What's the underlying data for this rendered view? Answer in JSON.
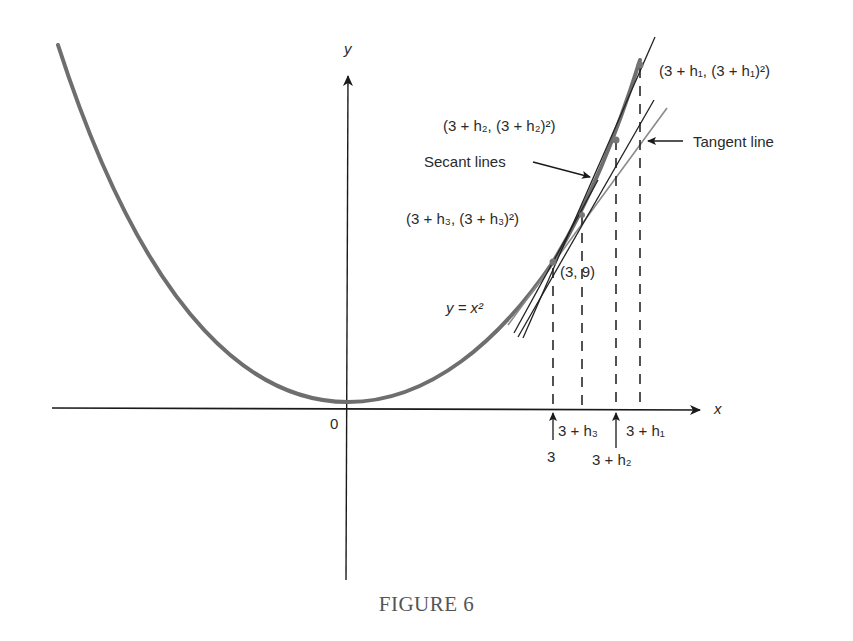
{
  "figure": {
    "caption": "FIGURE 6",
    "axes": {
      "x_label": "x",
      "y_label": "y",
      "origin_label": "0"
    },
    "curve_label": "y = x²",
    "points": [
      {
        "id": "p0",
        "label": "(3, 9)"
      },
      {
        "id": "p3",
        "label": "(3 + h₃, (3 + h₃)²)"
      },
      {
        "id": "p2",
        "label": "(3 + h₂, (3 + h₂)²)"
      },
      {
        "id": "p1",
        "label": "(3 + h₁, (3 + h₁)²)"
      }
    ],
    "x_ticks": [
      {
        "id": "t0",
        "label": "3"
      },
      {
        "id": "t3",
        "label": "3 + h₃"
      },
      {
        "id": "t2",
        "label": "3 + h₂"
      },
      {
        "id": "t1",
        "label": "3 + h₁"
      }
    ],
    "annotations": {
      "secant": "Secant lines",
      "tangent": "Tangent line"
    },
    "colors": {
      "curve": "#6e6e6e",
      "axis": "#1a1a1a",
      "tangent": "#8a8a8a",
      "secant": "#222222"
    }
  }
}
